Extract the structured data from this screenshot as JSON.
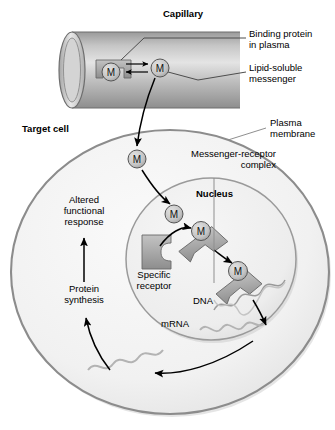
{
  "figure": {
    "width": 335,
    "height": 430,
    "background": "#ffffff"
  },
  "colors": {
    "background": "#ffffff",
    "cell_fill": "#f2f2f2",
    "cell_stroke": "#8c8c8c",
    "nucleus_fill": "#ededed",
    "nucleus_stroke": "#9a9a9a",
    "capillary_fill": "#b4b4b4",
    "capillary_stroke": "#6e6e6e",
    "protein_fill": "#a8a8a8",
    "protein_stroke": "#6a6a6a",
    "messenger_fill": "#c9c9c9",
    "messenger_stroke": "#555555",
    "arrow": "#000000",
    "leader": "#5a5a5a",
    "text": "#000000",
    "nucleic_acid": "#d9d9d9",
    "nucleic_acid_stroke": "#8f8f8f"
  },
  "labels": {
    "capillary": "Capillary",
    "binding_protein": "Binding protein\nin plasma",
    "lipid_soluble_messenger": "Lipid-soluble\nmessenger",
    "target_cell": "Target cell",
    "plasma_membrane": "Plasma\nmembrane",
    "messenger_receptor_complex": "Messenger-receptor\ncomplex",
    "nucleus": "Nucleus",
    "specific_receptor": "Specific\nreceptor",
    "altered_functional_response": "Altered\nfunctional\nresponse",
    "protein_synthesis": "Protein\nsynthesis",
    "dna": "DNA",
    "mrna": "mRNA"
  },
  "messenger_glyph": "M",
  "messengers": [
    {
      "id": "m-bound-in-plasma",
      "label": "M",
      "x": 111,
      "y": 72,
      "r": 9,
      "note": "messenger bound to plasma binding protein"
    },
    {
      "id": "m-free-in-plasma",
      "label": "M",
      "x": 160,
      "y": 68,
      "r": 9,
      "note": "free lipid-soluble messenger in capillary"
    },
    {
      "id": "m-in-cytosol",
      "label": "M",
      "x": 137,
      "y": 159,
      "r": 9,
      "note": "messenger crossing into target cell cytosol"
    },
    {
      "id": "m-entering-nucleus",
      "label": "M",
      "x": 174,
      "y": 214,
      "r": 9,
      "note": "messenger entering nucleus"
    },
    {
      "id": "m-on-receptor",
      "label": "M",
      "x": 201,
      "y": 231,
      "r": 9.5,
      "note": "messenger bound to specific receptor"
    },
    {
      "id": "m-complex-on-dna",
      "label": "M",
      "x": 238,
      "y": 271,
      "r": 9.5,
      "note": "messenger-receptor complex bound to DNA"
    }
  ],
  "label_positions": {
    "capillary": {
      "x": 163,
      "y": 14,
      "align": "left"
    },
    "binding_protein": {
      "x": 249,
      "y": 33,
      "align": "left"
    },
    "lipid_soluble_messenger": {
      "x": 249,
      "y": 67,
      "align": "left"
    },
    "target_cell": {
      "x": 22,
      "y": 128,
      "align": "left"
    },
    "plasma_membrane": {
      "x": 268,
      "y": 122,
      "align": "left"
    },
    "messenger_receptor_complex": {
      "x": 158,
      "y": 152,
      "align": "left"
    },
    "nucleus": {
      "x": 196,
      "y": 192,
      "align": "left"
    },
    "specific_receptor": {
      "x": 131,
      "y": 273,
      "align": "left"
    },
    "altered_functional_response": {
      "x": 52,
      "y": 198,
      "align": "left"
    },
    "protein_synthesis": {
      "x": 55,
      "y": 287,
      "align": "left"
    },
    "dna": {
      "x": 193,
      "y": 299,
      "align": "left"
    },
    "mrna": {
      "x": 163,
      "y": 322,
      "align": "left"
    }
  },
  "structures": {
    "capillary": {
      "cx_left": 72,
      "cx_right": 240,
      "cy": 70,
      "ry": 38,
      "rx_cap": 13
    },
    "target_cell": {
      "cx": 170,
      "cy": 272,
      "rx": 160,
      "ry": 144
    },
    "nucleus": {
      "cx": 211,
      "cy": 259,
      "rx": 86,
      "ry": 82
    }
  },
  "flow_steps": [
    "Lipid-soluble messenger dissociates from binding protein in plasma",
    "Messenger diffuses across the plasma membrane into the target cell",
    "Messenger binds its specific receptor forming a messenger-receptor complex",
    "Complex binds DNA in the nucleus",
    "mRNA is transcribed and exported to the cytosol",
    "Protein synthesis occurs",
    "Altered functional response"
  ]
}
